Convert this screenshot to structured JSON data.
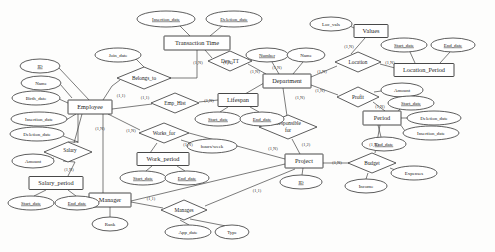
{
  "diagram": {
    "type": "entity-relationship",
    "entities": [
      {
        "id": "employee",
        "label": "Employee",
        "x": 90,
        "y": 107,
        "w": 44,
        "h": 14
      },
      {
        "id": "transaction_time",
        "label": "Transaction Time",
        "x": 197,
        "y": 43,
        "w": 66,
        "h": 14
      },
      {
        "id": "lifespan",
        "label": "Lifespan",
        "x": 238,
        "y": 100,
        "w": 40,
        "h": 13
      },
      {
        "id": "department",
        "label": "Department",
        "x": 287,
        "y": 81,
        "w": 48,
        "h": 14
      },
      {
        "id": "location_period",
        "label": "Location_Period",
        "x": 424,
        "y": 70,
        "w": 60,
        "h": 13
      },
      {
        "id": "values",
        "label": "Values",
        "x": 371,
        "y": 31,
        "w": 34,
        "h": 13
      },
      {
        "id": "period",
        "label": "Period",
        "x": 382,
        "y": 118,
        "w": 38,
        "h": 14
      },
      {
        "id": "project",
        "label": "Project",
        "x": 304,
        "y": 161,
        "w": 38,
        "h": 14
      },
      {
        "id": "work_period",
        "label": "Work_period",
        "x": 163,
        "y": 159,
        "w": 52,
        "h": 13
      },
      {
        "id": "manager",
        "label": "Manager",
        "x": 110,
        "y": 200,
        "w": 42,
        "h": 14
      },
      {
        "id": "salary_period",
        "label": "Salary_period",
        "x": 56,
        "y": 183,
        "w": 54,
        "h": 13
      }
    ],
    "relationships": [
      {
        "id": "belongs_to",
        "label": "Belongs_to",
        "x": 144,
        "y": 78,
        "rx": 27,
        "ry": 11
      },
      {
        "id": "dep_tt",
        "label": "Dep_TT",
        "x": 230,
        "y": 61,
        "rx": 22,
        "ry": 10
      },
      {
        "id": "emp_hist",
        "label": "Emp_Hist",
        "x": 175,
        "y": 103,
        "rx": 24,
        "ry": 10
      },
      {
        "id": "works_for",
        "label": "Works_for",
        "x": 164,
        "y": 133,
        "rx": 25,
        "ry": 10
      },
      {
        "id": "salary",
        "label": "Salary",
        "x": 68,
        "y": 152,
        "rx": 24,
        "ry": 10
      },
      {
        "id": "manages",
        "label": "Manages",
        "x": 184,
        "y": 210,
        "rx": 23,
        "ry": 10
      },
      {
        "id": "responsible_for",
        "label": "Responsible for",
        "x": 288,
        "y": 127,
        "rx": 29,
        "ry": 12
      },
      {
        "id": "budget",
        "label": "Budget",
        "x": 372,
        "y": 163,
        "rx": 24,
        "ry": 10
      },
      {
        "id": "profit",
        "label": "Profit",
        "x": 358,
        "y": 97,
        "rx": 21,
        "ry": 10
      },
      {
        "id": "location",
        "label": "Location",
        "x": 358,
        "y": 62,
        "rx": 23,
        "ry": 10
      }
    ],
    "attributes": [
      {
        "id": "emp_id",
        "label": "ID",
        "x": 40,
        "y": 66,
        "rx": 20,
        "ry": 7,
        "key": true
      },
      {
        "id": "emp_name",
        "label": "Name",
        "x": 41,
        "y": 83,
        "rx": 20,
        "ry": 7,
        "key": false
      },
      {
        "id": "emp_birth",
        "label": "Birth_date",
        "x": 36,
        "y": 98,
        "rx": 24,
        "ry": 7,
        "key": false
      },
      {
        "id": "emp_insertion",
        "label": "Insertion_date",
        "x": 39,
        "y": 119,
        "rx": 28,
        "ry": 7,
        "key": false
      },
      {
        "id": "emp_deletion",
        "label": "Deletion_date",
        "x": 37,
        "y": 134,
        "rx": 27,
        "ry": 7,
        "key": false
      },
      {
        "id": "sal_amount",
        "label": "Amount",
        "x": 33,
        "y": 161,
        "rx": 21,
        "ry": 7,
        "key": false
      },
      {
        "id": "salp_start",
        "label": "Start_date",
        "x": 31,
        "y": 203,
        "rx": 23,
        "ry": 7,
        "key": false
      },
      {
        "id": "salp_end",
        "label": "End_date",
        "x": 77,
        "y": 203,
        "rx": 22,
        "ry": 7,
        "key": false
      },
      {
        "id": "mgr_rank",
        "label": "Rank",
        "x": 110,
        "y": 224,
        "rx": 18,
        "ry": 7,
        "key": false
      },
      {
        "id": "join_date",
        "label": "Join_date",
        "x": 118,
        "y": 55,
        "rx": 23,
        "ry": 7,
        "key": false
      },
      {
        "id": "tt_insertion",
        "label": "Insertion_date",
        "x": 166,
        "y": 19,
        "rx": 29,
        "ry": 8,
        "key": false
      },
      {
        "id": "tt_deletion",
        "label": "Deletion_date",
        "x": 234,
        "y": 19,
        "rx": 28,
        "ry": 8,
        "key": false
      },
      {
        "id": "ls_start",
        "label": "Start_date",
        "x": 218,
        "y": 119,
        "rx": 23,
        "ry": 7,
        "key": false
      },
      {
        "id": "ls_end",
        "label": "End_date",
        "x": 262,
        "y": 119,
        "rx": 22,
        "ry": 7,
        "key": false
      },
      {
        "id": "hours_week",
        "label": "hours/week",
        "x": 212,
        "y": 146,
        "rx": 25,
        "ry": 7,
        "key": false
      },
      {
        "id": "wp_start",
        "label": "Start_date",
        "x": 143,
        "y": 178,
        "rx": 23,
        "ry": 7,
        "key": false
      },
      {
        "id": "wp_end",
        "label": "End_date",
        "x": 187,
        "y": 178,
        "rx": 22,
        "ry": 7,
        "key": false
      },
      {
        "id": "mng_app_date",
        "label": "App_date",
        "x": 188,
        "y": 232,
        "rx": 23,
        "ry": 7,
        "key": false
      },
      {
        "id": "mng_type",
        "label": "Type",
        "x": 232,
        "y": 232,
        "rx": 17,
        "ry": 7,
        "key": false
      },
      {
        "id": "dept_number",
        "label": "Number",
        "x": 267,
        "y": 55,
        "rx": 21,
        "ry": 7,
        "key": true
      },
      {
        "id": "dept_name",
        "label": "Name",
        "x": 306,
        "y": 55,
        "rx": 19,
        "ry": 7,
        "key": false
      },
      {
        "id": "loc_vals",
        "label": "Loc_vals",
        "x": 331,
        "y": 24,
        "rx": 21,
        "ry": 7,
        "key": false
      },
      {
        "id": "locp_start",
        "label": "Start_date",
        "x": 404,
        "y": 45,
        "rx": 23,
        "ry": 7,
        "key": false
      },
      {
        "id": "locp_end",
        "label": "End_date",
        "x": 453,
        "y": 45,
        "rx": 22,
        "ry": 7,
        "key": false
      },
      {
        "id": "profit_amount",
        "label": "Amount",
        "x": 402,
        "y": 90,
        "rx": 21,
        "ry": 7,
        "key": false
      },
      {
        "id": "per_start",
        "label": "Start_date",
        "x": 411,
        "y": 103,
        "rx": 23,
        "ry": 7,
        "key": false
      },
      {
        "id": "per_deletion",
        "label": "Deletion_date",
        "x": 434,
        "y": 118,
        "rx": 27,
        "ry": 7,
        "key": false
      },
      {
        "id": "per_insertion",
        "label": "Insertion_date",
        "x": 431,
        "y": 133,
        "rx": 28,
        "ry": 7,
        "key": false
      },
      {
        "id": "per_end",
        "label": "End_date",
        "x": 384,
        "y": 144,
        "rx": 22,
        "ry": 7,
        "key": false
      },
      {
        "id": "proj_id",
        "label": "ID",
        "x": 301,
        "y": 182,
        "rx": 21,
        "ry": 7,
        "key": true
      },
      {
        "id": "budget_income",
        "label": "Income",
        "x": 366,
        "y": 186,
        "rx": 21,
        "ry": 7,
        "key": false
      },
      {
        "id": "budget_expenses",
        "label": "Expenses",
        "x": 414,
        "y": 173,
        "rx": 23,
        "ry": 7,
        "key": false
      }
    ],
    "cardinalities": [
      {
        "id": "c1",
        "label": "(1,N)",
        "x": 198,
        "y": 63
      },
      {
        "id": "c2",
        "label": "(1,N)",
        "x": 228,
        "y": 63
      },
      {
        "id": "c3",
        "label": "(1,1)",
        "x": 121,
        "y": 96
      },
      {
        "id": "c4",
        "label": "(1,1)",
        "x": 145,
        "y": 98
      },
      {
        "id": "c5",
        "label": "(1,N)",
        "x": 209,
        "y": 101
      },
      {
        "id": "c6",
        "label": "(1,N)",
        "x": 100,
        "y": 129
      },
      {
        "id": "c7",
        "label": "(1,N)",
        "x": 131,
        "y": 131
      },
      {
        "id": "c8",
        "label": "(1,N)",
        "x": 188,
        "y": 145
      },
      {
        "id": "c9",
        "label": "(1,N)",
        "x": 69,
        "y": 170
      },
      {
        "id": "c10",
        "label": "(1,1)",
        "x": 151,
        "y": 199
      },
      {
        "id": "c11",
        "label": "(1,1)",
        "x": 257,
        "y": 191
      },
      {
        "id": "c12",
        "label": "(1,N)",
        "x": 273,
        "y": 149
      },
      {
        "id": "c13",
        "label": "(1,2)",
        "x": 306,
        "y": 145
      },
      {
        "id": "c14",
        "label": "(1,N)",
        "x": 255,
        "y": 72
      },
      {
        "id": "c15",
        "label": "(1,N)",
        "x": 277,
        "y": 68
      },
      {
        "id": "c16",
        "label": "(1,N)",
        "x": 322,
        "y": 72
      },
      {
        "id": "c17",
        "label": "(1,N)",
        "x": 320,
        "y": 91
      },
      {
        "id": "c18",
        "label": "(1,N)",
        "x": 300,
        "y": 98
      },
      {
        "id": "c19",
        "label": "(1,N)",
        "x": 349,
        "y": 47
      },
      {
        "id": "c20",
        "label": "(1,N)",
        "x": 390,
        "y": 63
      },
      {
        "id": "c21",
        "label": "(1,N)",
        "x": 380,
        "y": 107
      },
      {
        "id": "c22",
        "label": "(1,N)",
        "x": 337,
        "y": 163
      },
      {
        "id": "c23",
        "label": "(1,N)",
        "x": 374,
        "y": 145
      }
    ]
  }
}
